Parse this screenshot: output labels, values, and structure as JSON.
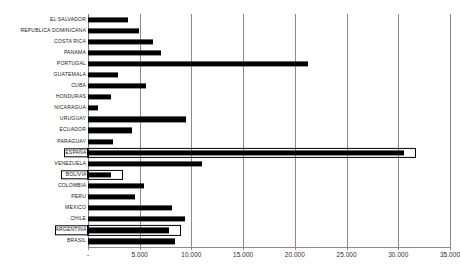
{
  "chart_data": {
    "type": "bar",
    "orientation": "horizontal",
    "title": "",
    "subtitle": "",
    "xlabel": "",
    "ylabel": "",
    "xlim": [
      0,
      35000
    ],
    "ylim": null,
    "grid": true,
    "grid_axis": "x",
    "legend": false,
    "legend_position": "none",
    "bar_color": "#000000",
    "gridline_color": "#8c8c8c",
    "highlight_style": "black rectangle outline",
    "x_ticks": [
      0,
      5000,
      10000,
      15000,
      20000,
      25000,
      30000,
      35000
    ],
    "x_tick_labels": [
      "-",
      "5.000",
      "10.000",
      "15.000",
      "20.000",
      "25.000",
      "30.000",
      "35.000"
    ],
    "categories": [
      "EL SALVADOR",
      "REPUBLICA DOMINICANA",
      "COSTA RICA",
      "PANAMA",
      "PORTUGAL",
      "GUATEMALA",
      "CUBA",
      "HONDURAS",
      "NICARAGUA",
      "URUGUAY",
      "ECUADOR",
      "PARAGUAY",
      "ESPAÑA",
      "VENEZUELA",
      "BOLIVIA",
      "COLOMBIA",
      "PERU",
      "MEXICO",
      "CHILE",
      "ARGENTINA",
      "BRASIL"
    ],
    "values": [
      3900,
      4900,
      6300,
      7100,
      21300,
      2900,
      5600,
      2200,
      1000,
      9500,
      4300,
      2400,
      30600,
      11000,
      2200,
      5400,
      4500,
      8100,
      9400,
      7800,
      8400
    ],
    "highlighted": [
      "ESPAÑA",
      "BOLIVIA",
      "ARGENTINA"
    ]
  }
}
